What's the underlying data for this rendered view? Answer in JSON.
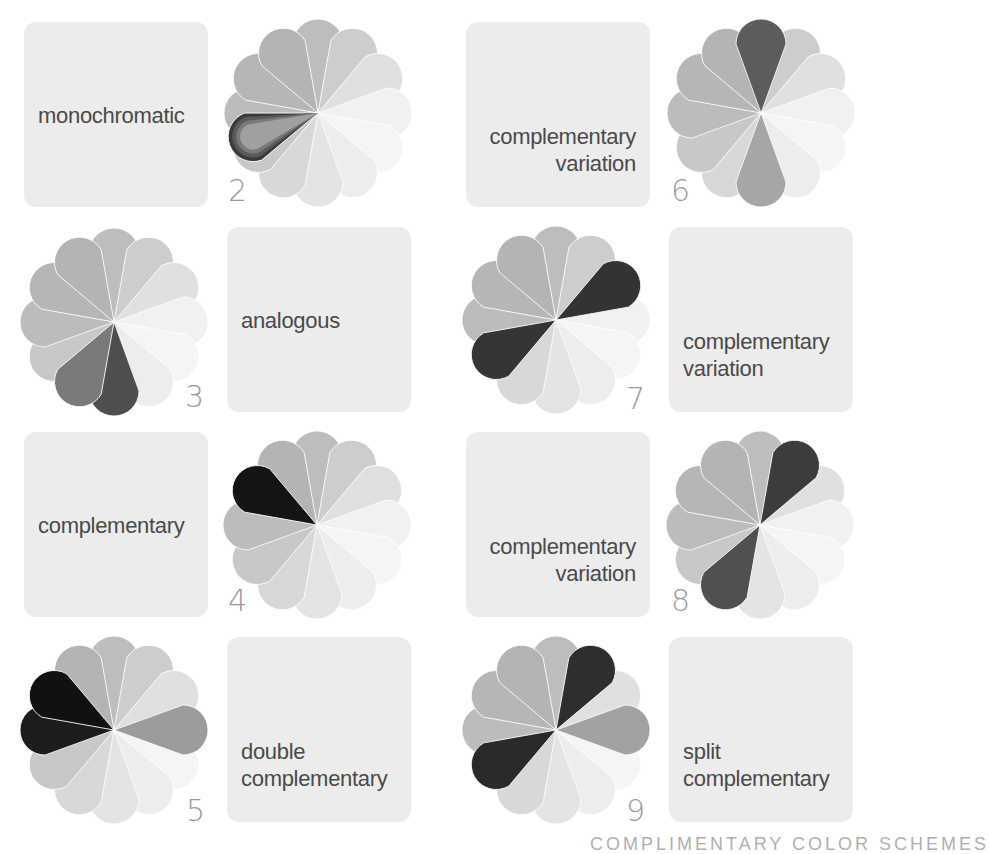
{
  "base_petals": [
    {
      "angle": 270,
      "color": "#bdbdbd"
    },
    {
      "angle": 300,
      "color": "#cdcdcd"
    },
    {
      "angle": 330,
      "color": "#e0e0e0"
    },
    {
      "angle": 0,
      "color": "#f1f1f1"
    },
    {
      "angle": 30,
      "color": "#f5f5f5"
    },
    {
      "angle": 60,
      "color": "#ededed"
    },
    {
      "angle": 90,
      "color": "#e4e4e4"
    },
    {
      "angle": 120,
      "color": "#d8d8d8"
    },
    {
      "angle": 150,
      "color": "#c8c8c8"
    },
    {
      "angle": 180,
      "color": "#bcbcbc"
    },
    {
      "angle": 210,
      "color": "#b6b6b6"
    },
    {
      "angle": 240,
      "color": "#b4b4b4"
    }
  ],
  "schemes": [
    {
      "id": 2,
      "label_lines": [
        "monochromatic"
      ],
      "number": "2",
      "overrides": [
        {
          "angle": 160,
          "color": "#3a3a3a",
          "layered": true
        }
      ]
    },
    {
      "id": 3,
      "label_lines": [
        "analogous"
      ],
      "number": "3",
      "overrides": [
        {
          "angle": 90,
          "color": "#4e4e4e"
        },
        {
          "angle": 120,
          "color": "#7a7a7a"
        }
      ]
    },
    {
      "id": 4,
      "label_lines": [
        "complementary"
      ],
      "number": "4",
      "overrides": [
        {
          "angle": 210,
          "color": "#141414"
        }
      ]
    },
    {
      "id": 5,
      "label_lines": [
        "double",
        "complementary"
      ],
      "number": "5",
      "overrides": [
        {
          "angle": 210,
          "color": "#111111"
        },
        {
          "angle": 180,
          "color": "#1c1c1c"
        },
        {
          "angle": 0,
          "color": "#9c9c9c"
        }
      ]
    },
    {
      "id": 6,
      "label_lines": [
        "complementary",
        "variation"
      ],
      "number": "6",
      "overrides": [
        {
          "angle": 270,
          "color": "#5c5c5c"
        },
        {
          "angle": 90,
          "color": "#a6a6a6"
        }
      ]
    },
    {
      "id": 7,
      "label_lines": [
        "complementary",
        "variation"
      ],
      "number": "7",
      "overrides": [
        {
          "angle": 330,
          "color": "#333333"
        },
        {
          "angle": 150,
          "color": "#353535"
        }
      ]
    },
    {
      "id": 8,
      "label_lines": [
        "complementary",
        "variation"
      ],
      "number": "8",
      "overrides": [
        {
          "angle": 300,
          "color": "#3c3c3c"
        },
        {
          "angle": 120,
          "color": "#505050"
        }
      ]
    },
    {
      "id": 9,
      "label_lines": [
        "split",
        "complementary"
      ],
      "number": "9",
      "overrides": [
        {
          "angle": 300,
          "color": "#2e2e2e"
        },
        {
          "angle": 150,
          "color": "#2a2a2a"
        },
        {
          "angle": 0,
          "color": "#a2a2a2"
        }
      ]
    }
  ],
  "footer": {
    "text": "COMPLIMENTARY COLOR SCHEMES"
  }
}
